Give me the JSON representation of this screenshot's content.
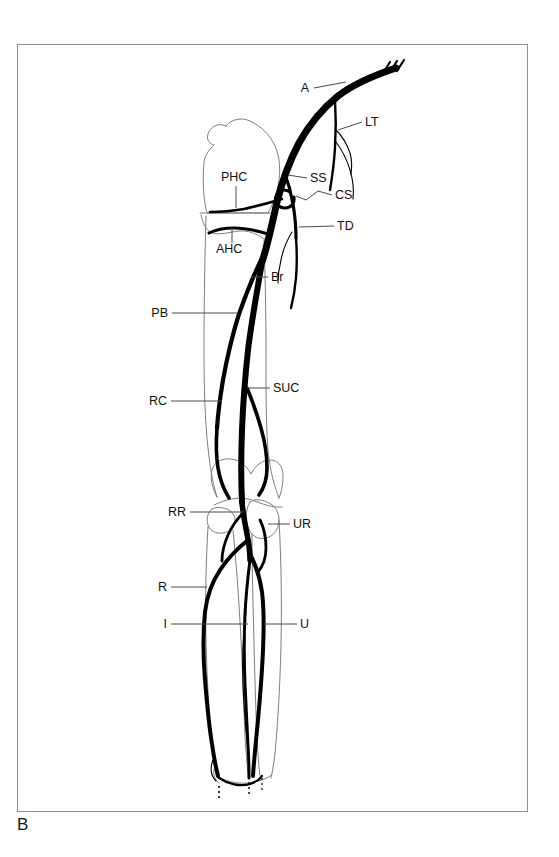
{
  "figure": {
    "panel_letter": "B",
    "frame": {
      "x": 17,
      "y": 44,
      "width": 511,
      "height": 768
    },
    "background_color": "#ffffff",
    "line_color": "#000000",
    "bone_outline_color": "#6f6f6f",
    "leader_color": "#4a4a4a"
  },
  "labels": [
    {
      "id": "A",
      "text": "A",
      "x": 309,
      "y": 92,
      "anchor": "end",
      "leader": "M 314 88 L 346 82"
    },
    {
      "id": "LT",
      "text": "LT",
      "x": 365,
      "y": 126,
      "anchor": "start",
      "leader": "M 362 122 L 338 130"
    },
    {
      "id": "SS",
      "text": "SS",
      "x": 310,
      "y": 182,
      "anchor": "start",
      "leader": "M 307 178 L 288 175"
    },
    {
      "id": "CS",
      "text": "CS",
      "x": 335,
      "y": 199,
      "anchor": "start",
      "leader": "M 332 195 L 318 191 L 306 200 L 296 196"
    },
    {
      "id": "TD",
      "text": "TD",
      "x": 337,
      "y": 230,
      "anchor": "start",
      "leader": "M 334 226 L 299 227"
    },
    {
      "id": "PHC",
      "text": "PHC",
      "x": 221,
      "y": 181,
      "anchor": "start",
      "leader": "M 236 186 L 236 208"
    },
    {
      "id": "AHC",
      "text": "AHC",
      "x": 216,
      "y": 253,
      "anchor": "start",
      "leader": "M 232 243 L 232 227"
    },
    {
      "id": "Br",
      "text": "Br",
      "x": 271,
      "y": 281,
      "anchor": "start",
      "leader": "M 268 277 L 251 277"
    },
    {
      "id": "PB",
      "text": "PB",
      "x": 168,
      "y": 317,
      "anchor": "end",
      "leader": "M 172 313 L 238 313"
    },
    {
      "id": "RC",
      "text": "RC",
      "x": 167,
      "y": 405,
      "anchor": "end",
      "leader": "M 171 401 L 222 401"
    },
    {
      "id": "SUC",
      "text": "SUC",
      "x": 273,
      "y": 392,
      "anchor": "start",
      "leader": "M 270 388 L 247 388"
    },
    {
      "id": "RR",
      "text": "RR",
      "x": 186,
      "y": 516,
      "anchor": "end",
      "leader": "M 190 512 L 244 512"
    },
    {
      "id": "UR",
      "text": "UR",
      "x": 293,
      "y": 528,
      "anchor": "start",
      "leader": "M 290 524 L 268 524"
    },
    {
      "id": "R",
      "text": "R",
      "x": 167,
      "y": 591,
      "anchor": "end",
      "leader": "M 171 587 L 207 587"
    },
    {
      "id": "I",
      "text": "I",
      "x": 167,
      "y": 628,
      "anchor": "end",
      "leader": "M 171 624 L 248 624"
    },
    {
      "id": "U",
      "text": "U",
      "x": 300,
      "y": 628,
      "anchor": "start",
      "leader": "M 297 624 L 264 624"
    }
  ],
  "legend_meaning": {
    "A": "Axillary artery",
    "LT": "Lateral thoracic artery",
    "SS": "Subscapular artery",
    "CS": "Circumflex scapular artery",
    "TD": "Thoracodorsal artery",
    "PHC": "Posterior humeral circumflex artery",
    "AHC": "Anterior humeral circumflex artery",
    "Br": "Brachial artery",
    "PB": "Profunda brachii artery",
    "RC": "Radial collateral artery",
    "SUC": "Superior ulnar collateral artery",
    "RR": "Radial recurrent artery",
    "UR": "Ulnar recurrent artery",
    "R": "Radial artery",
    "I": "Interosseous artery",
    "U": "Ulnar artery"
  }
}
